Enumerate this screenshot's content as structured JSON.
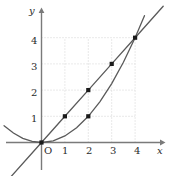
{
  "figure": {
    "title": "",
    "origin_label": "O",
    "x_axis_label": "x",
    "y_axis_label": "y"
  },
  "chart_data": {
    "type": "line",
    "title": "",
    "xlabel": "x",
    "ylabel": "y",
    "xlim": [
      -1.6,
      5.6
    ],
    "ylim": [
      -0.9,
      5.1
    ],
    "xticks": [
      1,
      2,
      3,
      4
    ],
    "yticks": [
      1,
      2,
      3,
      4
    ],
    "xtick_labels": [
      "1",
      "2",
      "3",
      "4"
    ],
    "ytick_labels": [
      "1",
      "2",
      "3",
      "4"
    ],
    "origin_label": "O",
    "grid": true,
    "grid_style": "dotted",
    "grid_color": "#cfcfcf",
    "axis_color": "#7a7a7a",
    "curve_color": "#5a5a5a",
    "marker_color": "#1a1a1a",
    "legend": false,
    "legend_position": "none",
    "series": [
      {
        "name": "y = x",
        "type": "line",
        "equation": "y = x",
        "color": "#5a5a5a",
        "x": [
          -1.4,
          0,
          1,
          2,
          3,
          4,
          5.2
        ],
        "values": [
          -1.4,
          0,
          1,
          2,
          3,
          4,
          5.2
        ]
      },
      {
        "name": "y = x^2/4",
        "type": "line",
        "equation": "y = x²/4",
        "color": "#5a5a5a",
        "x": [
          -1.6,
          -1.2,
          -0.8,
          -0.4,
          0,
          0.5,
          1,
          1.5,
          2,
          2.5,
          3,
          3.5,
          4,
          4.4
        ],
        "values": [
          0.64,
          0.36,
          0.16,
          0.04,
          0,
          0.0625,
          0.25,
          0.5625,
          1,
          1.5625,
          2.25,
          3.0625,
          4,
          4.84
        ]
      }
    ],
    "points": [
      {
        "label": "(0, 0)",
        "x": 0,
        "y": 0,
        "on": "both"
      },
      {
        "label": "(1, 1)",
        "x": 1,
        "y": 1,
        "on": "y = x"
      },
      {
        "label": "(2, 2)",
        "x": 2,
        "y": 2,
        "on": "y = x"
      },
      {
        "label": "(3, 3)",
        "x": 3,
        "y": 3,
        "on": "y = x"
      },
      {
        "label": "(4, 4)",
        "x": 4,
        "y": 4,
        "on": "both"
      },
      {
        "label": "(2, 1)",
        "x": 2,
        "y": 1,
        "on": "y = x^2/4"
      }
    ],
    "intersections": [
      {
        "label": "(0, 0)",
        "x": 0,
        "y": 0
      },
      {
        "label": "(4, 4)",
        "x": 4,
        "y": 4
      }
    ]
  }
}
